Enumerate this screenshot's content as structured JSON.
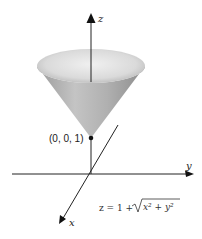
{
  "figure": {
    "axes": {
      "z_label": "z",
      "y_label": "y",
      "x_label": "x"
    },
    "point_label": "(0, 0, 1)",
    "equation": {
      "lhs": "z = 1 + ",
      "radicand": "x² + y²"
    },
    "surface": "cone",
    "colors": {
      "axis": "#111111",
      "cone_light": "#e6e6e6",
      "cone_dark": "#8a8a8a"
    }
  }
}
